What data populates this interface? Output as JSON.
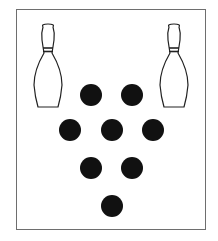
{
  "diagram": {
    "title": "",
    "colors": {
      "frame": "#6e6e6e",
      "dot": "#111111",
      "pin_stroke": "#222222",
      "pin_fill": "#ffffff"
    },
    "pins": [
      {
        "name": "left-pin",
        "cx": 48
      },
      {
        "name": "right-pin",
        "cx": 174
      }
    ],
    "dots": [
      {
        "cx": 91,
        "cy": 95
      },
      {
        "cx": 132,
        "cy": 95
      },
      {
        "cx": 70,
        "cy": 130
      },
      {
        "cx": 112,
        "cy": 130
      },
      {
        "cx": 153,
        "cy": 130
      },
      {
        "cx": 91,
        "cy": 168
      },
      {
        "cx": 132,
        "cy": 168
      },
      {
        "cx": 112,
        "cy": 206
      }
    ],
    "dot_count": 8,
    "dot_radius": 11
  }
}
